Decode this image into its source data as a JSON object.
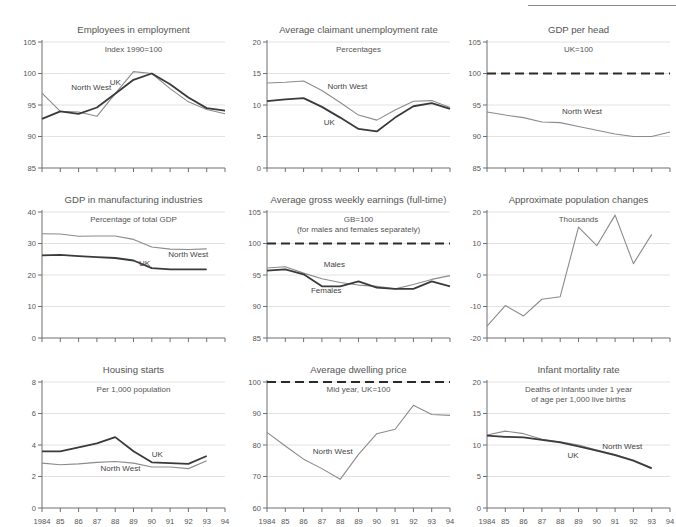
{
  "figure": {
    "rule": "horizontal-rule-top-right",
    "colors": {
      "north_west": "#8b8b8b",
      "uk": "#3a3a3a",
      "reference": "#2a2a2a",
      "grid": "#e2e2e2",
      "axis": "#6f6f6f"
    },
    "x_tick_labels": [
      "1984",
      "85",
      "86",
      "87",
      "88",
      "89",
      "90",
      "91",
      "92",
      "93",
      "94"
    ]
  },
  "chart_data": [
    {
      "type": "line",
      "title": "Employees in employment",
      "subtitle": "Index 1990=100",
      "xlabel": "",
      "ylabel": "",
      "ylim": [
        85,
        105
      ],
      "yticks": [
        85,
        90,
        95,
        100,
        105
      ],
      "grid": true,
      "legend": "inline-annotations",
      "x": [
        "1984",
        "85",
        "86",
        "87",
        "88",
        "89",
        "90",
        "91",
        "92",
        "93",
        "94"
      ],
      "series": [
        {
          "name": "North West",
          "values": [
            96.9,
            94.0,
            93.9,
            93.2,
            96.8,
            100.3,
            100.0,
            97.6,
            95.5,
            94.3,
            93.6
          ]
        },
        {
          "name": "UK",
          "values": [
            92.8,
            94.0,
            93.6,
            94.6,
            96.8,
            99.0,
            100.0,
            98.3,
            96.2,
            94.5,
            94.1
          ]
        }
      ]
    },
    {
      "type": "line",
      "title": "Average claimant unemployment rate",
      "subtitle": "Percentages",
      "xlabel": "",
      "ylabel": "",
      "ylim": [
        0,
        20
      ],
      "yticks": [
        0,
        5,
        10,
        15,
        20
      ],
      "grid": true,
      "legend": "inline-annotations",
      "x": [
        "1984",
        "85",
        "86",
        "87",
        "88",
        "89",
        "90",
        "91",
        "92",
        "93",
        "94"
      ],
      "series": [
        {
          "name": "North West",
          "values": [
            13.5,
            13.6,
            13.8,
            12.3,
            10.4,
            8.4,
            7.6,
            9.2,
            10.6,
            10.7,
            9.6
          ]
        },
        {
          "name": "UK",
          "values": [
            10.6,
            10.9,
            11.1,
            9.7,
            8.0,
            6.2,
            5.8,
            8.0,
            9.8,
            10.3,
            9.4
          ]
        }
      ]
    },
    {
      "type": "line",
      "title": "GDP per head",
      "subtitle": "UK=100",
      "xlabel": "",
      "ylabel": "",
      "ylim": [
        85,
        105
      ],
      "yticks": [
        85,
        90,
        95,
        100,
        105
      ],
      "grid": true,
      "legend": "inline-annotations",
      "reference_line": {
        "label": "UK=100",
        "value": 100,
        "style": "dashed"
      },
      "x": [
        "1984",
        "85",
        "86",
        "87",
        "88",
        "89",
        "90",
        "91",
        "92",
        "93",
        "94"
      ],
      "series": [
        {
          "name": "North West",
          "values": [
            93.9,
            93.4,
            93.0,
            92.3,
            92.2,
            91.6,
            91.0,
            90.4,
            90.0,
            90.0,
            90.7
          ]
        }
      ]
    },
    {
      "type": "line",
      "title": "GDP in manufacturing industries",
      "subtitle": "Percentage of total GDP",
      "xlabel": "",
      "ylabel": "",
      "ylim": [
        0,
        40
      ],
      "yticks": [
        0,
        10,
        20,
        30,
        40
      ],
      "grid": true,
      "legend": "inline-annotations",
      "x": [
        "1984",
        "85",
        "86",
        "87",
        "88",
        "89",
        "90",
        "91",
        "92",
        "93"
      ],
      "series": [
        {
          "name": "North West",
          "values": [
            33.1,
            33.0,
            32.3,
            32.4,
            32.4,
            31.3,
            28.9,
            28.2,
            28.1,
            28.3
          ]
        },
        {
          "name": "UK",
          "values": [
            26.2,
            26.4,
            26.0,
            25.7,
            25.4,
            24.6,
            22.2,
            21.8,
            21.8,
            21.8
          ]
        }
      ]
    },
    {
      "type": "line",
      "title": "Average gross weekly earnings (full-time)",
      "subtitle": "GB=100",
      "subtitle2": "(for males and females separately)",
      "xlabel": "",
      "ylabel": "",
      "ylim": [
        85,
        105
      ],
      "yticks": [
        85,
        90,
        95,
        100,
        105
      ],
      "grid": true,
      "legend": "inline-annotations",
      "reference_line": {
        "label": "GB=100",
        "value": 100,
        "style": "dashed"
      },
      "x": [
        "1984",
        "85",
        "86",
        "87",
        "88",
        "89",
        "90",
        "91",
        "92",
        "93",
        "94"
      ],
      "series": [
        {
          "name": "Males",
          "values": [
            96.1,
            96.3,
            95.3,
            94.4,
            93.8,
            93.4,
            93.2,
            92.8,
            93.5,
            94.3,
            94.9
          ]
        },
        {
          "name": "Females",
          "values": [
            95.7,
            95.9,
            95.1,
            93.2,
            93.2,
            94.0,
            93.0,
            92.8,
            92.8,
            94.0,
            93.2
          ]
        }
      ]
    },
    {
      "type": "line",
      "title": "Approximate population changes",
      "subtitle": "Thousands",
      "xlabel": "",
      "ylabel": "",
      "ylim": [
        -20,
        20
      ],
      "yticks": [
        -20,
        -10,
        0,
        10,
        20
      ],
      "grid": true,
      "legend": "none",
      "x": [
        "1984",
        "85",
        "86",
        "87",
        "88",
        "89",
        "90",
        "91",
        "92",
        "93"
      ],
      "series": [
        {
          "name": "North West",
          "values": [
            -16.2,
            -9.7,
            -13.0,
            -7.7,
            -6.9,
            15.2,
            9.3,
            19.0,
            3.6,
            12.9
          ]
        }
      ]
    },
    {
      "type": "line",
      "title": "Housing starts",
      "subtitle": "Per 1,000 population",
      "xlabel": "",
      "ylabel": "",
      "ylim": [
        0,
        8
      ],
      "yticks": [
        0,
        2,
        4,
        6,
        8
      ],
      "grid": true,
      "legend": "inline-annotations",
      "x": [
        "1984",
        "85",
        "86",
        "87",
        "88",
        "89",
        "90",
        "91",
        "92",
        "93"
      ],
      "series": [
        {
          "name": "North West",
          "values": [
            2.85,
            2.75,
            2.8,
            2.9,
            2.95,
            2.85,
            2.6,
            2.6,
            2.5,
            3.0
          ]
        },
        {
          "name": "UK",
          "values": [
            3.6,
            3.6,
            3.85,
            4.1,
            4.5,
            3.6,
            2.9,
            2.85,
            2.8,
            3.3
          ]
        }
      ]
    },
    {
      "type": "line",
      "title": "Average dwelling price",
      "subtitle": "Mid year, UK=100",
      "xlabel": "",
      "ylabel": "",
      "ylim": [
        60,
        100
      ],
      "yticks": [
        60,
        70,
        80,
        90,
        100
      ],
      "grid": true,
      "legend": "inline-annotations",
      "reference_line": {
        "label": "UK=100",
        "value": 100,
        "style": "dashed"
      },
      "x": [
        "1984",
        "85",
        "86",
        "87",
        "88",
        "89",
        "90",
        "91",
        "92",
        "93",
        "94"
      ],
      "series": [
        {
          "name": "North West",
          "values": [
            84.0,
            79.7,
            75.5,
            72.5,
            69.1,
            77.0,
            83.6,
            85.0,
            92.6,
            89.7,
            89.4
          ]
        }
      ]
    },
    {
      "type": "line",
      "title": "Infant mortality rate",
      "subtitle": "Deaths of infants under 1 year",
      "subtitle2": "of age per 1,000 live births",
      "xlabel": "",
      "ylabel": "",
      "ylim": [
        0,
        20
      ],
      "yticks": [
        0,
        5,
        10,
        15,
        20
      ],
      "grid": true,
      "legend": "inline-annotations",
      "x": [
        "1984",
        "85",
        "86",
        "87",
        "88",
        "89",
        "90",
        "91",
        "92",
        "93"
      ],
      "series": [
        {
          "name": "North West",
          "values": [
            11.6,
            12.2,
            11.8,
            10.9,
            10.5,
            10.0,
            9.2,
            8.5,
            7.6,
            6.4
          ]
        },
        {
          "name": "UK",
          "values": [
            11.5,
            11.3,
            11.2,
            10.8,
            10.4,
            9.8,
            9.1,
            8.4,
            7.5,
            6.3
          ]
        }
      ]
    }
  ],
  "annotations": [
    {
      "panel": 0,
      "texts": [
        "North West",
        "UK"
      ]
    },
    {
      "panel": 1,
      "texts": [
        "North West",
        "UK"
      ]
    },
    {
      "panel": 2,
      "texts": [
        "North West"
      ]
    },
    {
      "panel": 3,
      "texts": [
        "North West",
        "UK"
      ]
    },
    {
      "panel": 4,
      "texts": [
        "Males",
        "Females"
      ]
    },
    {
      "panel": 5,
      "texts": []
    },
    {
      "panel": 6,
      "texts": [
        "UK",
        "North West"
      ]
    },
    {
      "panel": 7,
      "texts": [
        "North West"
      ]
    },
    {
      "panel": 8,
      "texts": [
        "North West",
        "UK"
      ]
    }
  ]
}
